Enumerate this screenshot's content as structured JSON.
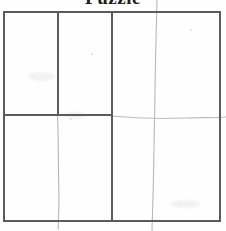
{
  "document": {
    "title": "Puzzle",
    "title_clipped": true,
    "background_color": "#fefefe",
    "width": 226,
    "height": 231
  },
  "palette": {
    "printed_line": "#5b5b5b",
    "pencil_line": "#b6b6b6",
    "pencil_line_faint": "#cccccc",
    "paper": "#fefefe",
    "title_ink": "#1d1d1d",
    "speck": "#dcdcdc"
  },
  "grid": {
    "name": "puzzle-grid",
    "border": {
      "left": 3,
      "top": 11,
      "right": 219,
      "bottom": 220,
      "color": "#5b5b5b",
      "thickness": 2
    },
    "printed_lines": [
      {
        "id": "border-top",
        "orientation": "horizontal",
        "x1": 3,
        "y1": 11,
        "x2": 219,
        "y2": 11
      },
      {
        "id": "border-bottom",
        "orientation": "horizontal",
        "x1": 3,
        "y1": 220,
        "x2": 219,
        "y2": 220
      },
      {
        "id": "border-left",
        "orientation": "vertical",
        "x1": 3,
        "y1": 11,
        "x2": 3,
        "y2": 220
      },
      {
        "id": "border-right",
        "orientation": "vertical",
        "x1": 219,
        "y1": 11,
        "x2": 219,
        "y2": 220
      },
      {
        "id": "divider-vertical-left",
        "orientation": "vertical",
        "x1": 57,
        "y1": 11,
        "x2": 57,
        "y2": 115
      },
      {
        "id": "divider-vertical-center",
        "orientation": "vertical",
        "x1": 111,
        "y1": 11,
        "x2": 111,
        "y2": 220
      },
      {
        "id": "divider-horizontal-left",
        "orientation": "horizontal",
        "x1": 3,
        "y1": 114,
        "x2": 111,
        "y2": 114
      }
    ],
    "pencil_lines": [
      {
        "id": "pencil-vertical-left",
        "description": "faint hand-drawn vertical stroke continuing below the left divider",
        "path": "M57.5,115 C58.6,140 58.2,165 58.8,190 C59.2,205 58.4,215 58.2,229"
      },
      {
        "id": "pencil-vertical-right",
        "description": "faint hand-drawn vertical stroke spanning full height in the right half",
        "path": "M157,0 C156.2,30 155.4,60 155.0,92 C154.6,120 154.2,150 153.4,182 C152.9,202 152.4,214 152.0,231"
      },
      {
        "id": "pencil-horizontal-right",
        "description": "faint hand-drawn horizontal stroke continuing right of the center divider",
        "path": "M111,116 C135,118 160,119 185,118 C200,117.4 212,117.8 226,117"
      }
    ],
    "cells": [
      {
        "id": "cell-top-left",
        "row": 1,
        "col": 1,
        "label": ""
      },
      {
        "id": "cell-top-middle",
        "row": 1,
        "col": 2,
        "label": ""
      },
      {
        "id": "cell-top-right",
        "row": 1,
        "col": 3,
        "label": ""
      },
      {
        "id": "cell-bottom-left",
        "row": 2,
        "col": 1,
        "label": ""
      },
      {
        "id": "cell-bottom-right",
        "row": 2,
        "col": 2,
        "label": ""
      }
    ]
  },
  "artifacts": {
    "specks": [
      {
        "x": 91,
        "y": 53,
        "size": 2
      },
      {
        "x": 190,
        "y": 29,
        "size": 2
      },
      {
        "x": 70,
        "y": 118,
        "size": 2
      }
    ],
    "smudges": [
      {
        "x": 28,
        "y": 72,
        "w": 26,
        "h": 9
      },
      {
        "x": 64,
        "y": 112,
        "w": 22,
        "h": 7
      },
      {
        "x": 170,
        "y": 200,
        "w": 30,
        "h": 8
      }
    ]
  }
}
